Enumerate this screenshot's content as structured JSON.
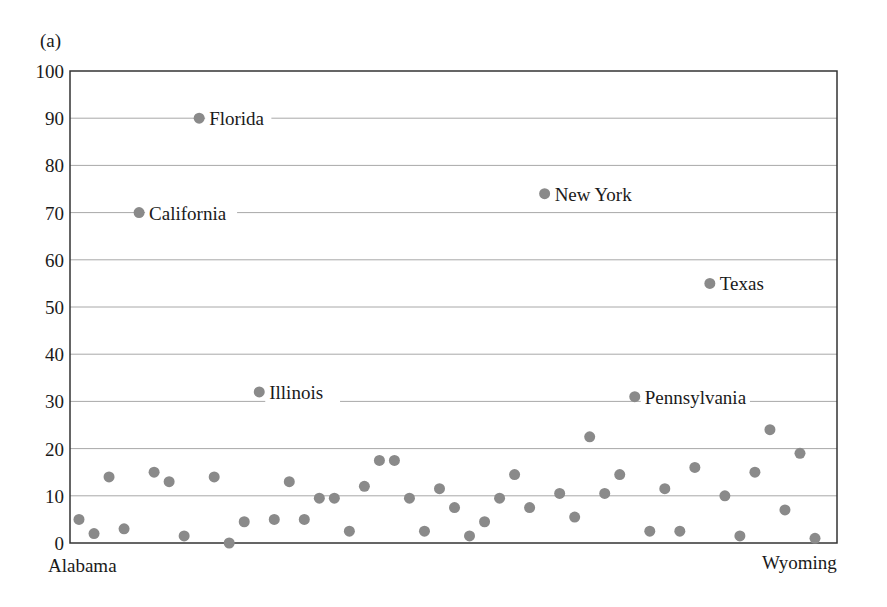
{
  "panel_label": "(a)",
  "colors": {
    "dot": "#8a8a8a",
    "grid": "#a8a8a8",
    "axis": "#333333",
    "text": "#1a1a1a",
    "background": "#ffffff"
  },
  "chart_data": {
    "type": "scatter",
    "title": "",
    "panel": "(a)",
    "xlabel": "",
    "ylabel": "",
    "ylim": [
      0,
      100
    ],
    "yticks": [
      0,
      10,
      20,
      30,
      40,
      50,
      60,
      70,
      80,
      90,
      100
    ],
    "grid": true,
    "x_tick_labels": {
      "first": "Alabama",
      "last": "Wyoming"
    },
    "annotations": [
      "California",
      "Florida",
      "Illinois",
      "New York",
      "Pennsylvania",
      "Texas"
    ],
    "categories": [
      "Alabama",
      "Alaska",
      "Arizona",
      "Arkansas",
      "California",
      "Colorado",
      "Connecticut",
      "Delaware",
      "Florida",
      "Georgia",
      "Hawaii",
      "Idaho",
      "Illinois",
      "Indiana",
      "Iowa",
      "Kansas",
      "Kentucky",
      "Louisiana",
      "Maine",
      "Maryland",
      "Massachusetts",
      "Michigan",
      "Minnesota",
      "Mississippi",
      "Missouri",
      "Montana",
      "Nebraska",
      "Nevada",
      "New Hampshire",
      "New Jersey",
      "New Mexico",
      "New York",
      "North Carolina",
      "North Dakota",
      "Ohio",
      "Oklahoma",
      "Oregon",
      "Pennsylvania",
      "Rhode Island",
      "South Carolina",
      "South Dakota",
      "Tennessee",
      "Texas",
      "Utah",
      "Vermont",
      "Virginia",
      "Washington",
      "West Virginia",
      "Wisconsin",
      "Wyoming"
    ],
    "values": [
      5,
      2,
      14,
      3,
      70,
      15,
      13,
      1.5,
      90,
      14,
      0,
      4.5,
      32,
      5,
      13,
      5,
      9.5,
      9.5,
      2.5,
      12,
      17.5,
      17.5,
      9.5,
      2.5,
      11.5,
      7.5,
      1.5,
      4.5,
      9.5,
      14.5,
      7.5,
      74,
      10.5,
      5.5,
      22.5,
      10.5,
      14.5,
      31,
      2.5,
      11.5,
      2.5,
      16,
      55,
      10,
      1.5,
      15,
      24,
      7,
      19,
      1
    ]
  }
}
